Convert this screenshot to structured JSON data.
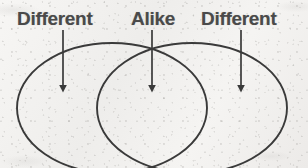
{
  "figure": {
    "kind": "venn-diagram",
    "set_count": 2,
    "background_color": "#f3f2f0",
    "ink_color": "#3a3a3a",
    "label_color": "#4a4a4a"
  },
  "labels": {
    "left": "Different",
    "middle": "Alike",
    "right": "Different"
  },
  "regions": [
    {
      "id": "left-only",
      "label": "Different",
      "meaning": "unique to left set"
    },
    {
      "id": "overlap",
      "label": "Alike",
      "meaning": "shared by both sets"
    },
    {
      "id": "right-only",
      "label": "Different",
      "meaning": "unique to right set"
    }
  ],
  "arrows": [
    {
      "id": "arrow-left",
      "points_to": "left-only",
      "from_x": 63,
      "from_y": 30,
      "to_x": 63,
      "to_y": 94
    },
    {
      "id": "arrow-middle",
      "points_to": "overlap",
      "from_x": 152,
      "from_y": 30,
      "to_x": 152,
      "to_y": 94
    },
    {
      "id": "arrow-right",
      "points_to": "right-only",
      "from_x": 241,
      "from_y": 30,
      "to_x": 241,
      "to_y": 94
    }
  ],
  "ellipses": [
    {
      "id": "left-ellipse",
      "cx": 112,
      "cy": 108,
      "rx": 95,
      "ry": 65
    },
    {
      "id": "right-ellipse",
      "cx": 192,
      "cy": 108,
      "rx": 95,
      "ry": 65
    }
  ]
}
